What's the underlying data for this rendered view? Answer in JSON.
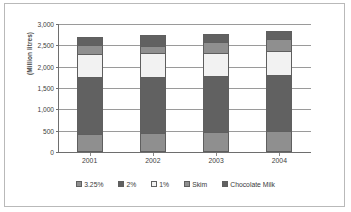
{
  "chart_data": {
    "type": "bar",
    "subtype": "stacked-vertical",
    "title": "",
    "xlabel": "",
    "ylabel": "(Million litres)",
    "ylim": [
      0,
      3000
    ],
    "ytick_step": 500,
    "ytick_labels": [
      "0",
      "500",
      "1,000",
      "1,500",
      "2,000",
      "2,500",
      "3,000"
    ],
    "ytick_values": [
      0,
      500,
      1000,
      1500,
      2000,
      2500,
      3000
    ],
    "grid": true,
    "grid_axis": "y",
    "legend_position": "bottom",
    "categories": [
      "2001",
      "2002",
      "2003",
      "2004"
    ],
    "series": [
      {
        "name": "3.25%",
        "color": "#8f8f8f",
        "values": [
          430,
          450,
          460,
          490
        ]
      },
      {
        "name": "2%",
        "color": "#616161",
        "values": [
          1320,
          1310,
          1320,
          1310
        ]
      },
      {
        "name": "1%",
        "color": "#f2f2f2",
        "values": [
          550,
          570,
          550,
          560
        ]
      },
      {
        "name": "Skim",
        "color": "#8f8f8f",
        "values": [
          220,
          160,
          250,
          290
        ]
      },
      {
        "name": "Chocolate Milk",
        "color": "#616161",
        "values": [
          180,
          260,
          180,
          180
        ]
      }
    ],
    "totals": [
      2700,
      2750,
      2760,
      2830
    ]
  },
  "legend": {
    "items": [
      {
        "label": "3.25%",
        "swatch": "legend-swatch-3-25-percent"
      },
      {
        "label": "2%",
        "swatch": "legend-swatch-2-percent"
      },
      {
        "label": "1%",
        "swatch": "legend-swatch-1-percent"
      },
      {
        "label": "Skim",
        "swatch": "legend-swatch-skim"
      },
      {
        "label": "Chocolate Milk",
        "swatch": "legend-swatch-chocolate-milk"
      }
    ]
  },
  "style": {
    "frame_border": "#b9b9b9",
    "gridline": "#9a9a9a",
    "axis": "#6e6e6e",
    "text": "#3d3d3d",
    "plot_background": "#ffffff"
  }
}
